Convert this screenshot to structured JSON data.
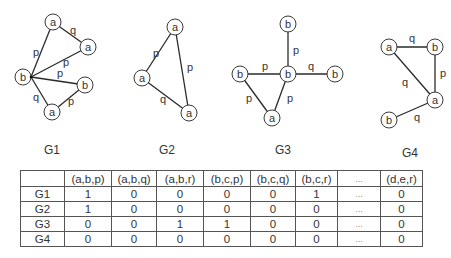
{
  "graphs": [
    {
      "id": "G1",
      "label": "G1",
      "label_pos": [
        52,
        150
      ],
      "nodes": [
        {
          "label": "a",
          "x": 53,
          "y": 22
        },
        {
          "label": "a",
          "x": 88,
          "y": 47
        },
        {
          "label": "b",
          "x": 23,
          "y": 77
        },
        {
          "label": "b",
          "x": 85,
          "y": 85
        },
        {
          "label": "a",
          "x": 52,
          "y": 112
        }
      ],
      "hub": [
        31,
        77
      ],
      "edges": [
        {
          "from": [
            53,
            22
          ],
          "to": [
            88,
            47
          ],
          "label": "q",
          "lx": 73,
          "ly": 30
        },
        {
          "from": [
            31,
            77
          ],
          "to": [
            53,
            22
          ],
          "label": "p",
          "lx": 36,
          "ly": 52
        },
        {
          "from": [
            31,
            77
          ],
          "to": [
            88,
            47
          ],
          "label": "p",
          "lx": 66,
          "ly": 62
        },
        {
          "from": [
            31,
            77
          ],
          "to": [
            85,
            85
          ],
          "label": "p",
          "lx": 60,
          "ly": 73
        },
        {
          "from": [
            31,
            77
          ],
          "to": [
            52,
            112
          ],
          "label": "q",
          "lx": 36,
          "ly": 97
        },
        {
          "from": [
            52,
            112
          ],
          "to": [
            85,
            85
          ],
          "label": "p",
          "lx": 71,
          "ly": 101
        }
      ]
    },
    {
      "id": "G2",
      "label": "G2",
      "label_pos": [
        167,
        150
      ],
      "nodes": [
        {
          "label": "a",
          "x": 175,
          "y": 27
        },
        {
          "label": "a",
          "x": 142,
          "y": 78
        },
        {
          "label": "a",
          "x": 189,
          "y": 113
        }
      ],
      "edges": [
        {
          "from": [
            175,
            27
          ],
          "to": [
            142,
            78
          ],
          "label": "p",
          "lx": 156,
          "ly": 53
        },
        {
          "from": [
            175,
            27
          ],
          "to": [
            189,
            113
          ],
          "label": "p",
          "lx": 190,
          "ly": 67
        },
        {
          "from": [
            142,
            78
          ],
          "to": [
            189,
            113
          ],
          "label": "q",
          "lx": 163,
          "ly": 99
        }
      ]
    },
    {
      "id": "G3",
      "label": "G3",
      "label_pos": [
        283,
        150
      ],
      "nodes": [
        {
          "label": "b",
          "x": 288,
          "y": 24
        },
        {
          "label": "b",
          "x": 240,
          "y": 74
        },
        {
          "label": "b",
          "x": 288,
          "y": 74
        },
        {
          "label": "b",
          "x": 335,
          "y": 74
        },
        {
          "label": "a",
          "x": 272,
          "y": 118
        }
      ],
      "edges": [
        {
          "from": [
            288,
            24
          ],
          "to": [
            288,
            74
          ],
          "label": "p",
          "lx": 296,
          "ly": 50
        },
        {
          "from": [
            240,
            74
          ],
          "to": [
            288,
            74
          ],
          "label": "p",
          "lx": 265,
          "ly": 66
        },
        {
          "from": [
            288,
            74
          ],
          "to": [
            335,
            74
          ],
          "label": "q",
          "lx": 311,
          "ly": 66
        },
        {
          "from": [
            240,
            74
          ],
          "to": [
            272,
            118
          ],
          "label": "p",
          "lx": 249,
          "ly": 98
        },
        {
          "from": [
            288,
            74
          ],
          "to": [
            272,
            118
          ],
          "label": "p",
          "lx": 290,
          "ly": 98
        }
      ]
    },
    {
      "id": "G4",
      "label": "G4",
      "label_pos": [
        410,
        153
      ],
      "nodes": [
        {
          "label": "a",
          "x": 389,
          "y": 47
        },
        {
          "label": "b",
          "x": 435,
          "y": 47
        },
        {
          "label": "a",
          "x": 435,
          "y": 100
        },
        {
          "label": "b",
          "x": 389,
          "y": 120
        }
      ],
      "edges": [
        {
          "from": [
            389,
            47
          ],
          "to": [
            435,
            47
          ],
          "label": "q",
          "lx": 412,
          "ly": 38
        },
        {
          "from": [
            435,
            47
          ],
          "to": [
            435,
            100
          ],
          "label": "p",
          "lx": 443,
          "ly": 73
        },
        {
          "from": [
            389,
            47
          ],
          "to": [
            435,
            100
          ],
          "label": "q",
          "lx": 405,
          "ly": 82
        },
        {
          "from": [
            389,
            120
          ],
          "to": [
            435,
            100
          ],
          "label": "q",
          "lx": 417,
          "ly": 117
        }
      ]
    }
  ],
  "table": {
    "columns": [
      "",
      "(a,b,p)",
      "(a,b,q)",
      "(a,b,r)",
      "(b,c,p)",
      "(b,c,q)",
      "(b,c,r)",
      "...",
      "(d,e,r)"
    ],
    "rows": [
      {
        "label": "G1",
        "values": [
          "1",
          "0",
          "0",
          "0",
          "0",
          "1",
          "...",
          "0"
        ]
      },
      {
        "label": "G2",
        "values": [
          "1",
          "0",
          "0",
          "0",
          "0",
          "0",
          "...",
          "0"
        ]
      },
      {
        "label": "G3",
        "values": [
          "0",
          "0",
          "1",
          "1",
          "0",
          "0",
          "...",
          "0"
        ]
      },
      {
        "label": "G4",
        "values": [
          "0",
          "0",
          "0",
          "0",
          "0",
          "0",
          "...",
          "0"
        ]
      }
    ]
  },
  "style": {
    "edge_color": "#2a2a2a",
    "node_stroke": "#3a3a3a",
    "table_border": "#555555",
    "node_radius": 8
  }
}
